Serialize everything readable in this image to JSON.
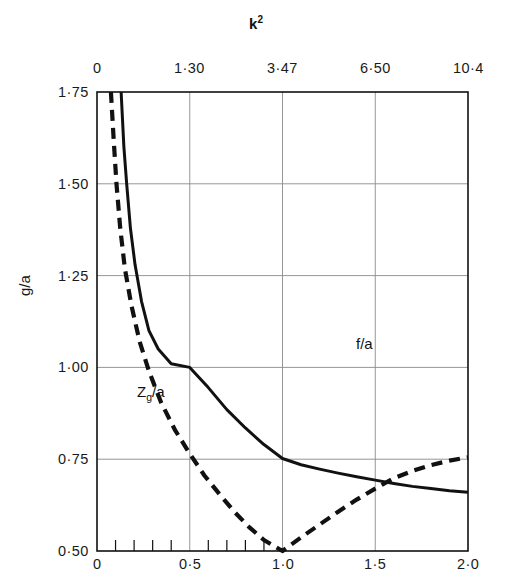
{
  "chart_data": {
    "type": "line",
    "xlabel": "",
    "ylabel": "g/a",
    "top_axis": {
      "label": "k²",
      "ticks": [
        "0",
        "1·30",
        "3·47",
        "6·50",
        "10·4"
      ],
      "tick_positions_x": [
        0,
        0.5,
        1.0,
        1.5,
        2.0
      ]
    },
    "bottom_axis": {
      "ticks": [
        "0",
        "0·5",
        "1·0",
        "1·5",
        "2·0"
      ],
      "tick_positions_x": [
        0,
        0.5,
        1.0,
        1.5,
        2.0
      ],
      "minor_tick_step": 0.1,
      "minor_tick_range": [
        0,
        1.0
      ],
      "xlim": [
        0,
        2.0
      ]
    },
    "yaxis": {
      "ticks": [
        "1·75",
        "1·50",
        "1·25",
        "1·00",
        "0·75",
        "0·50"
      ],
      "tick_values": [
        1.75,
        1.5,
        1.25,
        1.0,
        0.75,
        0.5
      ],
      "ylim": [
        0.5,
        1.75
      ]
    },
    "grid": "on",
    "grid_x": [
      0.5,
      1.0,
      1.5
    ],
    "grid_y": [
      1.5,
      1.25,
      1.0,
      0.75
    ],
    "legend_position": "inline-annotations",
    "series": [
      {
        "name": "f/a",
        "style": "solid",
        "color": "#111111",
        "label": "f/a",
        "points": [
          [
            0.13,
            1.75
          ],
          [
            0.145,
            1.6
          ],
          [
            0.16,
            1.5
          ],
          [
            0.18,
            1.38
          ],
          [
            0.205,
            1.28
          ],
          [
            0.24,
            1.18
          ],
          [
            0.28,
            1.1
          ],
          [
            0.33,
            1.05
          ],
          [
            0.4,
            1.01
          ],
          [
            0.5,
            1.0
          ],
          [
            0.6,
            0.945
          ],
          [
            0.7,
            0.885
          ],
          [
            0.8,
            0.835
          ],
          [
            0.9,
            0.79
          ],
          [
            1.0,
            0.752
          ],
          [
            1.1,
            0.735
          ],
          [
            1.2,
            0.723
          ],
          [
            1.3,
            0.712
          ],
          [
            1.4,
            0.702
          ],
          [
            1.5,
            0.693
          ],
          [
            1.6,
            0.684
          ],
          [
            1.7,
            0.676
          ],
          [
            1.8,
            0.67
          ],
          [
            1.9,
            0.664
          ],
          [
            2.0,
            0.66
          ]
        ]
      },
      {
        "name": "Zg/a",
        "style": "dashed",
        "color": "#111111",
        "label": "Z",
        "label_sub": "g",
        "label_tail": "/a",
        "points": [
          [
            0.075,
            1.75
          ],
          [
            0.09,
            1.62
          ],
          [
            0.105,
            1.5
          ],
          [
            0.125,
            1.38
          ],
          [
            0.15,
            1.27
          ],
          [
            0.185,
            1.17
          ],
          [
            0.23,
            1.07
          ],
          [
            0.28,
            0.99
          ],
          [
            0.345,
            0.905
          ],
          [
            0.42,
            0.83
          ],
          [
            0.5,
            0.765
          ],
          [
            0.58,
            0.705
          ],
          [
            0.66,
            0.655
          ],
          [
            0.74,
            0.607
          ],
          [
            0.82,
            0.565
          ],
          [
            0.9,
            0.53
          ],
          [
            1.0,
            0.5
          ],
          [
            1.1,
            0.537
          ],
          [
            1.2,
            0.572
          ],
          [
            1.3,
            0.607
          ],
          [
            1.4,
            0.64
          ],
          [
            1.5,
            0.67
          ],
          [
            1.6,
            0.698
          ],
          [
            1.7,
            0.718
          ],
          [
            1.8,
            0.734
          ],
          [
            1.9,
            0.746
          ],
          [
            2.0,
            0.755
          ]
        ]
      }
    ],
    "annotations": [
      {
        "text": "f/a",
        "x": 1.06,
        "y": 1.06
      },
      {
        "text": "Zg/a",
        "x": 0.16,
        "y": 0.93
      }
    ]
  },
  "plot_frame": {
    "left_px": 97,
    "right_px": 468,
    "top_px": 92,
    "bottom_px": 551
  }
}
